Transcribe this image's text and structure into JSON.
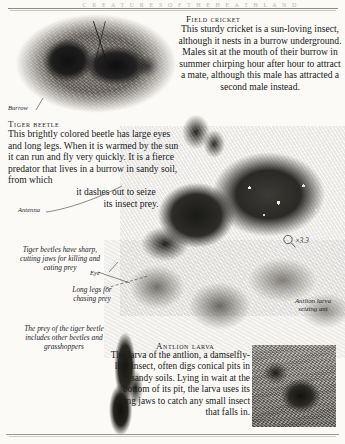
{
  "page": {
    "running_header": "C R E A T U R E S   O F   T H E   H E A T H L A N D",
    "background_color": "#fbfaf7",
    "ink_color": "#1a1a1d"
  },
  "sections": {
    "field_cricket": {
      "heading": "Field cricket",
      "body": "This sturdy cricket is a sun-loving insect, although it nests in a burrow underground. Males sit at the mouth of their burrow in summer chirping hour after hour to attract a mate, although this male has attracted a second male instead."
    },
    "tiger_beetle": {
      "heading": "Tiger beetle",
      "body_line1": "This brightly colored beetle has large eyes",
      "body_line2": "and long legs. When it is warmed by the",
      "body_line3": "sun it can run and fly very quickly. It",
      "body_line4": "is a fierce predator that lives in a",
      "body_line5": "burrow in sandy soil, from which",
      "body_line6": "it dashes out to seize",
      "body_line7": "its insect prey."
    },
    "antlion_larva": {
      "heading": "Antlion larva",
      "body": "The larva of the antlion, a damselfly-like insect, often digs conical pits in sandy soils. Lying in wait at the bottom of its pit, the larva uses its long jaws to catch any small insect that falls in."
    }
  },
  "captions": {
    "jaws": "Tiger beetles have sharp, cutting jaws for killing and eating prey",
    "long_legs": "Long legs for chasing prey",
    "prey": "The prey of the tiger beetle includes other beetles and grasshoppers",
    "antlion_seizing": "Antlion larva seizing ant"
  },
  "labels": {
    "burrow": "Burrow",
    "antenna": "Antenna",
    "eye": "Eye"
  },
  "magnification": {
    "icon": "magnifier-icon",
    "value": "×3.3"
  },
  "photos": {
    "cricket": "field-cricket-photograph",
    "beetle": "tiger-beetle-photograph",
    "plant": "heather-sprig-photograph",
    "antlion": "antlion-larva-photograph",
    "twig": "dark-twig-photograph"
  }
}
